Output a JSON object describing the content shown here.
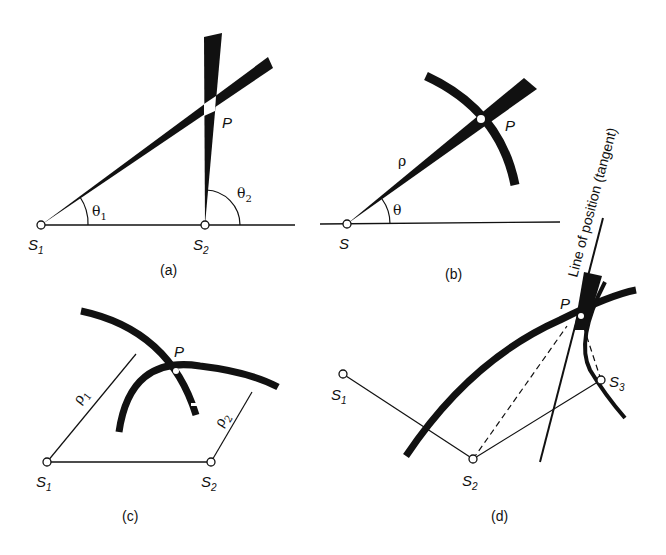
{
  "panels": [
    {
      "id": "a",
      "caption": "(a)",
      "labels": {
        "s1": "S",
        "s1_sub": "1",
        "s2": "S",
        "s2_sub": "2",
        "p": "P",
        "theta1": "θ",
        "theta1_sub": "1",
        "theta2": "θ",
        "theta2_sub": "2"
      }
    },
    {
      "id": "b",
      "caption": "(b)",
      "labels": {
        "s": "S",
        "p": "P",
        "rho": "ρ",
        "theta": "θ"
      }
    },
    {
      "id": "c",
      "caption": "(c)",
      "labels": {
        "s1": "S",
        "s1_sub": "1",
        "s2": "S",
        "s2_sub": "2",
        "p": "P",
        "rho1": "ρ",
        "rho1_sub": "1",
        "rho2": "ρ",
        "rho2_sub": "2"
      }
    },
    {
      "id": "d",
      "caption": "(d)",
      "labels": {
        "s1": "S",
        "s1_sub": "1",
        "s2": "S",
        "s2_sub": "2",
        "s3": "S",
        "s3_sub": "3",
        "p": "P",
        "tangent": "Line of position (tangent)"
      }
    }
  ],
  "colors": {
    "ink": "#111111",
    "paper": "#ffffff"
  }
}
